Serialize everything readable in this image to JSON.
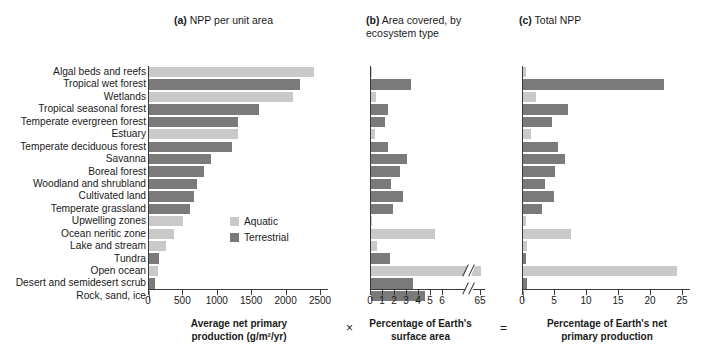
{
  "figure": {
    "panels": [
      {
        "key": "a",
        "marker": "(a)",
        "title": "NPP per unit area"
      },
      {
        "key": "b",
        "marker": "(b)",
        "title": "Area covered, by\necosystem type"
      },
      {
        "key": "c",
        "marker": "(c)",
        "title": "Total NPP"
      }
    ],
    "operators": {
      "multiply": "×",
      "equals": "="
    },
    "legend": {
      "items": [
        {
          "label": "Aquatic",
          "color": "#c9c9c9"
        },
        {
          "label": "Terrestrial",
          "color": "#7a7a7a"
        }
      ]
    },
    "colors": {
      "aquatic": "#c9c9c9",
      "terrestrial": "#7a7a7a",
      "axis": "#3a3a3a",
      "background": "#ffffff"
    }
  },
  "categories": [
    {
      "label": "Algal beds and reefs",
      "type": "Aquatic"
    },
    {
      "label": "Tropical wet forest",
      "type": "Terrestrial"
    },
    {
      "label": "Wetlands",
      "type": "Aquatic"
    },
    {
      "label": "Tropical seasonal forest",
      "type": "Terrestrial"
    },
    {
      "label": "Temperate evergreen forest",
      "type": "Terrestrial"
    },
    {
      "label": "Estuary",
      "type": "Aquatic"
    },
    {
      "label": "Temperate deciduous forest",
      "type": "Terrestrial"
    },
    {
      "label": "Savanna",
      "type": "Terrestrial"
    },
    {
      "label": "Boreal forest",
      "type": "Terrestrial"
    },
    {
      "label": "Woodland and shrubland",
      "type": "Terrestrial"
    },
    {
      "label": "Cultivated land",
      "type": "Terrestrial"
    },
    {
      "label": "Temperate grassland",
      "type": "Terrestrial"
    },
    {
      "label": "Upwelling zones",
      "type": "Aquatic"
    },
    {
      "label": "Ocean neritic zone",
      "type": "Aquatic"
    },
    {
      "label": "Lake and stream",
      "type": "Aquatic"
    },
    {
      "label": "Tundra",
      "type": "Terrestrial"
    },
    {
      "label": "Open ocean",
      "type": "Aquatic"
    },
    {
      "label": "Desert and semidesert scrub",
      "type": "Terrestrial"
    },
    {
      "label": "Rock, sand, ice",
      "type": "Terrestrial"
    }
  ],
  "chart_data": [
    {
      "type": "bar",
      "orientation": "horizontal",
      "panel": "a",
      "title": "(a) NPP per unit area",
      "xlabel": "Average net primary production (g/m2/yr)",
      "xlabel_display": "Average net primary\nproduction (g/m²/yr)",
      "ylabel": "",
      "xlim": [
        0,
        2500
      ],
      "xticks": [
        0,
        500,
        1000,
        1500,
        2000,
        2500
      ],
      "grid": false,
      "categories": [
        "Algal beds and reefs",
        "Tropical wet forest",
        "Wetlands",
        "Tropical seasonal forest",
        "Temperate evergreen forest",
        "Estuary",
        "Temperate deciduous forest",
        "Savanna",
        "Boreal forest",
        "Woodland and shrubland",
        "Cultivated land",
        "Temperate grassland",
        "Upwelling zones",
        "Ocean neritic zone",
        "Lake and stream",
        "Tundra",
        "Open ocean",
        "Desert and semidesert scrub",
        "Rock, sand, ice"
      ],
      "values": [
        2400,
        2200,
        2100,
        1600,
        1300,
        1300,
        1200,
        900,
        800,
        700,
        650,
        600,
        500,
        360,
        250,
        140,
        125,
        90,
        10
      ]
    },
    {
      "type": "bar",
      "orientation": "horizontal",
      "panel": "b",
      "title": "(b) Area covered, by ecosystem type",
      "xlabel": "Percentage of Earth's surface area",
      "xlabel_display": "Percentage of Earth's\nsurface area",
      "ylabel": "",
      "xlim": [
        0,
        6
      ],
      "xticks": [
        0,
        1,
        2,
        3,
        4,
        5,
        6
      ],
      "axis_break": {
        "after": 6,
        "resume_label": "65",
        "note": "axis broken between 6 and 65"
      },
      "grid": false,
      "categories": [
        "Algal beds and reefs",
        "Tropical wet forest",
        "Wetlands",
        "Tropical seasonal forest",
        "Temperate evergreen forest",
        "Estuary",
        "Temperate deciduous forest",
        "Savanna",
        "Boreal forest",
        "Woodland and shrubland",
        "Cultivated land",
        "Temperate grassland",
        "Upwelling zones",
        "Ocean neritic zone",
        "Lake and stream",
        "Tundra",
        "Open ocean",
        "Desert and semidesert scrub",
        "Rock, sand, ice"
      ],
      "values": [
        0.1,
        3.3,
        0.4,
        1.4,
        1.2,
        0.3,
        1.4,
        3.0,
        2.4,
        1.7,
        2.7,
        1.8,
        0.1,
        5.3,
        0.5,
        1.6,
        65.0,
        3.5,
        4.5
      ]
    },
    {
      "type": "bar",
      "orientation": "horizontal",
      "panel": "c",
      "title": "(c) Total NPP",
      "xlabel": "Percentage of Earth's net primary production",
      "xlabel_display": "Percentage of Earth's net\nprimary production",
      "ylabel": "",
      "xlim": [
        0,
        25
      ],
      "xticks": [
        0,
        5,
        10,
        15,
        20,
        25
      ],
      "grid": false,
      "categories": [
        "Algal beds and reefs",
        "Tropical wet forest",
        "Wetlands",
        "Tropical seasonal forest",
        "Temperate evergreen forest",
        "Estuary",
        "Temperate deciduous forest",
        "Savanna",
        "Boreal forest",
        "Woodland and shrubland",
        "Cultivated land",
        "Temperate grassland",
        "Upwelling zones",
        "Ocean neritic zone",
        "Lake and stream",
        "Tundra",
        "Open ocean",
        "Desert and semidesert scrub",
        "Rock, sand, ice"
      ],
      "values": [
        0.5,
        22.0,
        2.0,
        7.0,
        4.5,
        1.2,
        5.5,
        6.5,
        5.0,
        3.5,
        4.8,
        3.0,
        0.4,
        7.5,
        0.7,
        0.5,
        24.0,
        0.6,
        0.1
      ]
    }
  ]
}
